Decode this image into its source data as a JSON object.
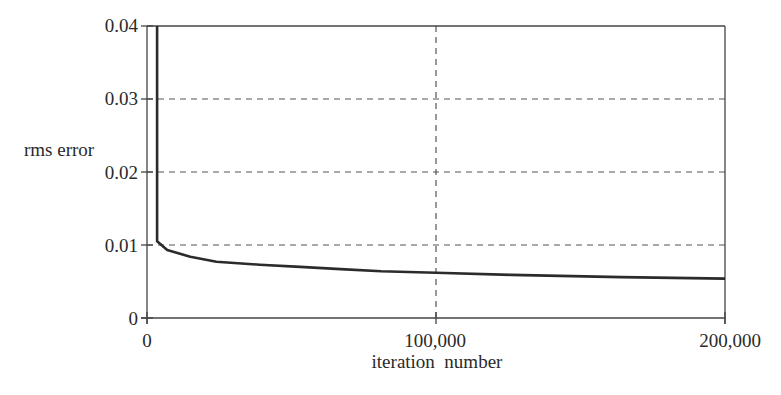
{
  "chart_data": {
    "type": "line",
    "title": "",
    "xlabel": "iteration  number",
    "ylabel": "rms error",
    "xlim": [
      0,
      200000
    ],
    "ylim": [
      0,
      0.04
    ],
    "x_ticks": [
      0,
      100000,
      200000
    ],
    "x_tick_labels": [
      "0",
      "100,000",
      "200,000"
    ],
    "y_ticks": [
      0,
      0.01,
      0.02,
      0.03,
      0.04
    ],
    "y_tick_labels": [
      "0",
      "0.01",
      "0.02",
      "0.03",
      "0.04"
    ],
    "grid": {
      "horizontal": true,
      "vertical_at": [
        100000
      ],
      "style": "dashed"
    },
    "legend": null,
    "series": [
      {
        "name": "rms error",
        "x": [
          3500,
          3500,
          7000,
          15000,
          24000,
          39000,
          53000,
          67000,
          81000,
          100000,
          126000,
          164000,
          200000
        ],
        "y": [
          0.04,
          0.0105,
          0.0093,
          0.0084,
          0.0077,
          0.0073,
          0.007,
          0.0067,
          0.0064,
          0.0062,
          0.0059,
          0.0056,
          0.0054
        ]
      }
    ]
  },
  "labels": {
    "ylabel": "rms error",
    "xlabel": "iteration  number",
    "yticks": [
      "0.04",
      "0.03",
      "0.02",
      "0.01",
      "0"
    ],
    "xticks": [
      "0",
      "100,000",
      "200,000"
    ]
  },
  "colors": {
    "line": "#2b2b2b",
    "axis": "#444444",
    "grid": "#555555"
  }
}
